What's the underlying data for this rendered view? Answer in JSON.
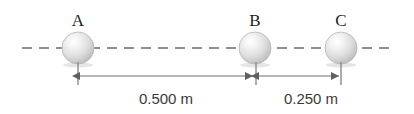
{
  "figure": {
    "background": "#ffffff",
    "line_color": "#8c8c8c",
    "arrow_color": "#6e6e6e",
    "label_color": "#231f20",
    "dim_label_color": "#3a3a3a",
    "sphere_fill_light": "#fcfcfc",
    "sphere_fill_mid": "#dcdcdc",
    "sphere_fill_dark": "#a9a9a9"
  },
  "spheres": [
    {
      "id": "A",
      "label": "A",
      "cx": 78,
      "cy": 48,
      "r": 16
    },
    {
      "id": "B",
      "label": "B",
      "cx": 255,
      "cy": 48,
      "r": 16
    },
    {
      "id": "C",
      "label": "C",
      "cx": 341,
      "cy": 48,
      "r": 16
    }
  ],
  "axis": {
    "y": 48,
    "x_start": 22,
    "x_end": 392,
    "dash": "10 7",
    "style": "dashed"
  },
  "dimensions": [
    {
      "id": "A-to-B",
      "label": "0.500 m",
      "from": "A",
      "to": "B",
      "value": 0.5,
      "unit": "m",
      "x1": 78,
      "x2": 255,
      "y": 76,
      "label_x": 166,
      "label_y": 104
    },
    {
      "id": "B-to-C",
      "label": "0.250 m",
      "from": "B",
      "to": "C",
      "value": 0.25,
      "unit": "m",
      "x1": 255,
      "x2": 341,
      "y": 76,
      "label_x": 311,
      "label_y": 104
    }
  ],
  "ticks": [
    {
      "id": "tick-A",
      "x": 78,
      "y1": 62,
      "y2": 85
    },
    {
      "id": "tick-B",
      "x": 256,
      "y1": 62,
      "y2": 85
    },
    {
      "id": "tick-C",
      "x": 341,
      "y1": 62,
      "y2": 85
    }
  ]
}
